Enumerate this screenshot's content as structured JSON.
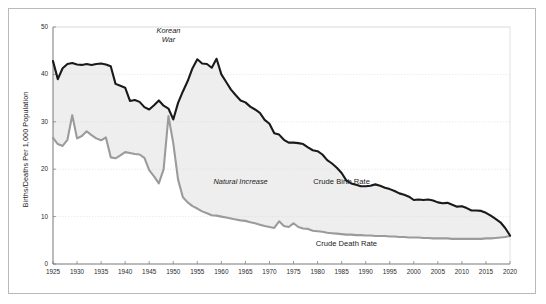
{
  "figure": {
    "background": "#ffffff",
    "frame_color": "#b9b9b9"
  },
  "chart_data": {
    "type": "line",
    "title": "",
    "subtitle": "",
    "xlabel": "",
    "ylabel": "Births/Deaths Per 1,000 Population",
    "xlim": [
      1925,
      2020
    ],
    "ylim": [
      0,
      50
    ],
    "grid": true,
    "grid_axis": "y",
    "legend_position": "inline-annotations",
    "x_ticks": [
      1925,
      1930,
      1935,
      1940,
      1945,
      1950,
      1955,
      1960,
      1965,
      1970,
      1975,
      1980,
      1985,
      1990,
      1995,
      2000,
      2005,
      2010,
      2015,
      2020
    ],
    "x_tick_labels": [
      "1925",
      "1930",
      "1935",
      "1940",
      "1945",
      "1950",
      "1955",
      "1960",
      "1965",
      "1970",
      "1975",
      "1980",
      "1985",
      "1990",
      "1995",
      "2000",
      "2005",
      "2010",
      "2015",
      "2020"
    ],
    "y_ticks": [
      0,
      10,
      20,
      30,
      40,
      50
    ],
    "y_tick_labels": [
      "0",
      "10",
      "20",
      "30",
      "40",
      "50"
    ],
    "x": [
      1925,
      1926,
      1927,
      1928,
      1929,
      1930,
      1931,
      1932,
      1933,
      1934,
      1935,
      1936,
      1937,
      1938,
      1939,
      1940,
      1941,
      1942,
      1943,
      1944,
      1945,
      1946,
      1947,
      1948,
      1949,
      1950,
      1951,
      1952,
      1953,
      1954,
      1955,
      1956,
      1957,
      1958,
      1959,
      1960,
      1961,
      1962,
      1963,
      1964,
      1965,
      1966,
      1967,
      1968,
      1969,
      1970,
      1971,
      1972,
      1973,
      1974,
      1975,
      1976,
      1977,
      1978,
      1979,
      1980,
      1981,
      1982,
      1983,
      1984,
      1985,
      1986,
      1987,
      1988,
      1989,
      1990,
      1991,
      1992,
      1993,
      1994,
      1995,
      1996,
      1997,
      1998,
      1999,
      2000,
      2001,
      2002,
      2003,
      2004,
      2005,
      2006,
      2007,
      2008,
      2009,
      2010,
      2011,
      2012,
      2013,
      2014,
      2015,
      2016,
      2017,
      2018,
      2019,
      2020
    ],
    "series": [
      {
        "name": "Crude Birth Rate",
        "color": "#1a1a1a",
        "linewidth": 2.1,
        "values": [
          42.8,
          39.0,
          41.3,
          42.2,
          42.4,
          42.1,
          42.0,
          42.2,
          42.0,
          42.2,
          42.3,
          42.1,
          41.7,
          38.0,
          37.6,
          37.2,
          34.4,
          34.6,
          34.2,
          33.1,
          32.6,
          33.5,
          34.5,
          33.4,
          32.8,
          30.5,
          34.0,
          36.4,
          38.6,
          41.3,
          43.2,
          42.3,
          42.2,
          41.4,
          43.3,
          40.0,
          38.4,
          36.8,
          35.6,
          34.5,
          34.1,
          33.2,
          32.6,
          31.9,
          30.4,
          29.6,
          27.6,
          27.3,
          26.2,
          25.6,
          25.6,
          25.5,
          25.3,
          24.6,
          24.0,
          23.8,
          23.1,
          21.9,
          21.2,
          20.3,
          19.2,
          17.6,
          17.0,
          16.7,
          16.4,
          16.4,
          16.5,
          16.8,
          16.5,
          16.1,
          15.8,
          15.4,
          14.9,
          14.6,
          14.2,
          13.5,
          13.6,
          13.5,
          13.6,
          13.4,
          13.0,
          12.8,
          12.9,
          12.5,
          12.1,
          12.2,
          11.8,
          11.3,
          11.3,
          11.2,
          10.8,
          10.2,
          9.5,
          8.8,
          7.6,
          6.0
        ]
      },
      {
        "name": "Crude Death Rate",
        "color": "#9b9b9b",
        "linewidth": 2.1,
        "values": [
          26.6,
          25.3,
          24.9,
          26.2,
          31.4,
          26.5,
          27.0,
          28.0,
          27.2,
          26.5,
          26.1,
          26.7,
          22.5,
          22.3,
          22.9,
          23.6,
          23.4,
          23.2,
          23.1,
          22.4,
          19.8,
          18.5,
          17.0,
          20.0,
          31.2,
          25.5,
          17.8,
          14.1,
          13.0,
          12.2,
          11.7,
          11.1,
          10.7,
          10.3,
          10.2,
          10.0,
          9.8,
          9.6,
          9.4,
          9.2,
          9.1,
          8.8,
          8.6,
          8.3,
          8.0,
          7.8,
          7.6,
          9.0,
          8.0,
          7.8,
          8.6,
          7.8,
          7.5,
          7.4,
          7.0,
          6.9,
          6.8,
          6.6,
          6.5,
          6.4,
          6.3,
          6.2,
          6.2,
          6.1,
          6.1,
          6.0,
          6.0,
          5.9,
          5.9,
          5.9,
          5.8,
          5.8,
          5.7,
          5.7,
          5.6,
          5.6,
          5.6,
          5.5,
          5.5,
          5.4,
          5.4,
          5.4,
          5.4,
          5.3,
          5.3,
          5.3,
          5.3,
          5.3,
          5.3,
          5.3,
          5.4,
          5.4,
          5.5,
          5.6,
          5.7,
          5.9
        ]
      }
    ],
    "fill": {
      "label": "Natural Increase",
      "between": [
        "Crude Birth Rate",
        "Crude Death Rate"
      ],
      "color": "#eeeeee"
    },
    "annotations": [
      {
        "id": "korean-war",
        "text_line1": "Korean",
        "text_line2": "War",
        "style": "italic",
        "x": 1949,
        "y": 49
      },
      {
        "id": "natural-increase",
        "text": "Natural Increase",
        "style": "italic",
        "x": 1964,
        "y": 17
      },
      {
        "id": "crude-birth-rate",
        "text": "Crude Birth Rate",
        "style": "normal",
        "x": 1985,
        "y": 17
      },
      {
        "id": "crude-death-rate",
        "text": "Crude Death Rate",
        "style": "normal",
        "x": 1986,
        "y": 4
      }
    ]
  }
}
